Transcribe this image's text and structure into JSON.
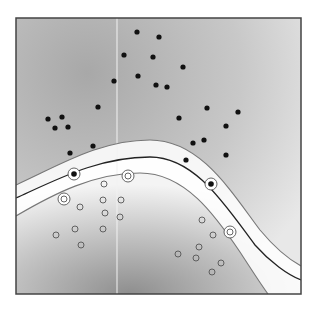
{
  "figure": {
    "type": "svm-decision-boundary",
    "frame": {
      "x": 16,
      "y": 18,
      "width": 285,
      "height": 276
    },
    "colors": {
      "background": "#ffffff",
      "frame": "#444444",
      "field_dark": "#9a9a9a",
      "field_light": "#ffffff",
      "decision_line": "#222222",
      "margin_line": "#777777",
      "filled_point": "#111111",
      "open_point": "#555555"
    },
    "vertical_artifact_x": 117
  },
  "chart_data": {
    "type": "scatter",
    "title": "",
    "xlabel": "",
    "ylabel": "",
    "grid": false,
    "legend": "none",
    "series": [
      {
        "name": "class-positive (filled)",
        "marker": "filled-circle",
        "points": [
          [
            137,
            32
          ],
          [
            159,
            37
          ],
          [
            124,
            55
          ],
          [
            153,
            57
          ],
          [
            183,
            67
          ],
          [
            138,
            76
          ],
          [
            114,
            81
          ],
          [
            156,
            85
          ],
          [
            167,
            87
          ],
          [
            98,
            107
          ],
          [
            48,
            119
          ],
          [
            62,
            117
          ],
          [
            55,
            128
          ],
          [
            68,
            127
          ],
          [
            207,
            108
          ],
          [
            238,
            112
          ],
          [
            179,
            118
          ],
          [
            226,
            126
          ],
          [
            93,
            146
          ],
          [
            193,
            143
          ],
          [
            204,
            140
          ],
          [
            70,
            153
          ],
          [
            186,
            160
          ],
          [
            226,
            155
          ]
        ]
      },
      {
        "name": "class-negative (open)",
        "marker": "open-circle",
        "points": [
          [
            104,
            184
          ],
          [
            80,
            207
          ],
          [
            103,
            200
          ],
          [
            121,
            200
          ],
          [
            105,
            213
          ],
          [
            75,
            229
          ],
          [
            120,
            217
          ],
          [
            103,
            229
          ],
          [
            56,
            235
          ],
          [
            81,
            245
          ],
          [
            202,
            220
          ],
          [
            213,
            235
          ],
          [
            199,
            247
          ],
          [
            178,
            254
          ],
          [
            196,
            258
          ],
          [
            212,
            272
          ],
          [
            221,
            263
          ]
        ]
      },
      {
        "name": "support-vectors-positive",
        "marker": "filled-circle-ringed",
        "points": [
          [
            74,
            174
          ],
          [
            211,
            184
          ]
        ]
      },
      {
        "name": "support-vectors-negative",
        "marker": "open-circle-ringed",
        "points": [
          [
            128,
            176
          ],
          [
            64,
            199
          ],
          [
            230,
            232
          ]
        ]
      }
    ],
    "curves": [
      {
        "name": "upper-margin",
        "style": "gray",
        "path": "M16,185 C60,165 100,140 150,140 C200,140 230,190 260,230 C275,248 290,260 301,266"
      },
      {
        "name": "decision-boundary",
        "style": "dark",
        "path": "M16,198 C60,178 100,157 150,157 C195,157 225,205 255,245 C270,262 288,275 301,280"
      },
      {
        "name": "lower-margin",
        "style": "gray",
        "path": "M16,216 C55,193 95,173 140,173 C185,173 215,215 240,252 C253,272 262,286 268,294"
      }
    ]
  }
}
